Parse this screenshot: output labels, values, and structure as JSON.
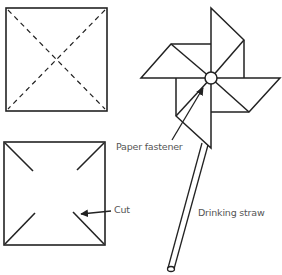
{
  "diagram": {
    "colors": {
      "line": "#222222",
      "label": "#555555",
      "background": "#ffffff"
    },
    "panels": [
      {
        "id": "fold-square",
        "description": "Square with dashed diagonal fold lines"
      },
      {
        "id": "cut-square",
        "description": "Square with four diagonal cuts from corners toward center"
      },
      {
        "id": "pinwheel",
        "description": "Assembled pinwheel on a straw"
      }
    ],
    "labels": {
      "cut": "Cut",
      "paper_fastener": "Paper fastener",
      "drinking_straw": "Drinking straw"
    }
  }
}
